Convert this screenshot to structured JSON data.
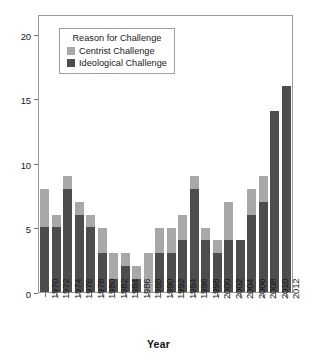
{
  "chart_data": {
    "type": "bar",
    "stacked": true,
    "title": "",
    "xlabel": "Year",
    "ylabel": "",
    "grid": false,
    "ylim": [
      0,
      21
    ],
    "yticks": [
      0,
      5,
      10,
      15,
      20
    ],
    "ytick_labels": [
      "0",
      "5",
      "10",
      "15",
      "20"
    ],
    "categories": [
      "1970",
      "1972",
      "1974",
      "1976",
      "1978",
      "1980",
      "1982",
      "1984",
      "1986",
      "1988",
      "1990",
      "1992",
      "1994",
      "1996",
      "1998",
      "2000",
      "2002",
      "2004",
      "2006",
      "2008",
      "2010",
      "2012"
    ],
    "series": [
      {
        "name": "Ideological Challenge",
        "color": "#4d4d4d",
        "values": [
          5,
          5,
          8,
          6,
          5,
          3,
          1,
          2,
          1,
          0,
          3,
          3,
          4,
          8,
          4,
          3,
          4,
          4,
          6,
          7,
          14,
          16
        ]
      },
      {
        "name": "Centrist Challenge",
        "color": "#a8a8a8",
        "values": [
          3,
          1,
          1,
          1,
          1,
          2,
          2,
          1,
          1,
          3,
          2,
          2,
          2,
          1,
          1,
          1,
          3,
          0,
          2,
          2,
          0,
          0
        ]
      }
    ],
    "totals": [
      8,
      6,
      9,
      7,
      6,
      5,
      3,
      3,
      2,
      3,
      5,
      5,
      6,
      9,
      5,
      4,
      7,
      4,
      8,
      9,
      14,
      16
    ],
    "legend": {
      "title": "Reason for Challenge",
      "position": "upper-left-inside",
      "entries": [
        {
          "label": "Centrist Challenge",
          "color": "#a8a8a8"
        },
        {
          "label": "Ideological Challenge",
          "color": "#4d4d4d"
        }
      ]
    }
  }
}
